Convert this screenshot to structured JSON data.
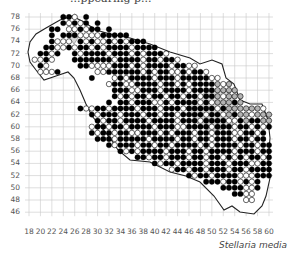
{
  "header": {
    "cropped_title": "...ppearing p..."
  },
  "map": {
    "species_label": "Stellaria media",
    "x_ticks": [
      18,
      20,
      22,
      24,
      26,
      28,
      30,
      32,
      34,
      36,
      38,
      40,
      42,
      44,
      46,
      48,
      50,
      52,
      54,
      56,
      58,
      60
    ],
    "y_ticks": [
      78,
      76,
      74,
      72,
      70,
      68,
      66,
      64,
      62,
      60,
      58,
      56,
      54,
      52,
      50,
      48,
      46
    ],
    "colors": {
      "present": "#000000",
      "absent": "#ffffff",
      "historic": "#b3b3b3",
      "water": "#d9d9d9",
      "grid": "#c8c8c8",
      "border": "#222222"
    },
    "legend_codes": {
      "B": "filled (present)",
      "W": "open circle",
      "G": "gray circle"
    },
    "x_start": 18,
    "y_start": 78,
    "rows": [
      "......BBW.B................................",
      "......BWBWB.B..............................",
      "....BB.WWBWBB.B............................",
      "....B.BBBWWWWBBBBB.........................",
      "....BWWW.BWBWWBWBWBBB.....................",
      "...BBWWBWBBWBWBBBBWBBBB....................",
      "..BBWB..BWBBBBWBBBWBWBBBW..................",
      ".WWBW...BBBBBBBWBBBBWBBWBBW................",
      "..BW.....BBWWWWBBBWBWBBBBWBBWW.............",
      "..WWWB......WWBBBBBBWBWBBWWBWBBW...........",
      "...........B...WBWBBBBWBBBWBBBBBWW.........",
      "..............WBBWWBBBBWBBWBWBBBBGWG.......",
      "...............BBBWWBBBWBBBBWBBBBGGGG......",
      "...............BWBWBBWBBWBBWBBWBBGWGGG.....",
      "..............B.BBWBBBWWBWBBBBWBWGGGBG.....",
      ".........BWWBBWBBBBWBBBWBBBWBBBBBWBGGGGGGW.",
      "...........BWBBBWBBBWBBWBBWBBBBWBBWGBGGWGGG",
      "............BWBBWBBBBWBBBBWBBBWBBBBWWBGBBGG",
      "...........WBBWBBWBBBBWBBBWWBBBBWBBBWBBWBWB",
      "...........BWBBWBBWWBBBWBWBBBWBBWBBBWWBBWB.",
      "............BBBWBBBBBWBBBBWBBWBBWBBBWBBWBB.",
      "..............BWBBBWBBWBBWBBBBWBWBBBBWBBWBB",
      "................BWBWBBBBWBBBWBBWBBBBWBBBWBB",
      "...................BBWBBWBBBWBBWBBWBWBWBBWB",
      "......................BWBBWBBBBWBBBWBBBWWBB",
      ".........................WBBWBBWBBBWBBWBBBB",
      "............................BWBBWBBBBWWWBBB",
      "...............................BBBWBBWBWB..",
      "..................................BBBBWWB..",
      "....................................BBWW...",
      "......................................WW...",
      "...........................................",
      "..........................................."
    ]
  }
}
